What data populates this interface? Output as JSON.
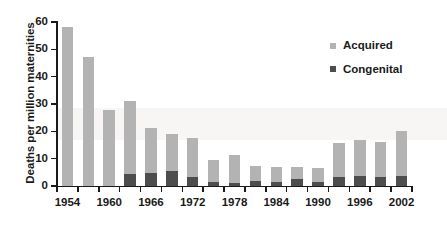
{
  "chart_data": {
    "type": "bar",
    "barmode": "stacked",
    "title": "",
    "xlabel": "",
    "ylabel": "Deaths per million maternities",
    "ylim": [
      0,
      60
    ],
    "ytick_labels": [
      "0",
      "10",
      "20",
      "30",
      "40",
      "50",
      "60"
    ],
    "ytick_values": [
      0,
      10,
      20,
      30,
      40,
      50,
      60
    ],
    "grid": false,
    "legend_position": "top-right",
    "categories": [
      1954,
      1957,
      1960,
      1963,
      1966,
      1969,
      1972,
      1975,
      1978,
      1981,
      1984,
      1987,
      1990,
      1993,
      1996,
      1999,
      2002
    ],
    "xtick_labels": [
      "1954",
      "1960",
      "1966",
      "1972",
      "1978",
      "1984",
      "1990",
      "1996",
      "2002"
    ],
    "xtick_values": [
      1954,
      1960,
      1966,
      1972,
      1978,
      1984,
      1990,
      1996,
      2002
    ],
    "series": [
      {
        "name": "Congenital",
        "color": "#4d4d4d",
        "values": [
          0,
          0,
          0,
          4.5,
          4.8,
          5.5,
          3.2,
          1.6,
          1.2,
          1.8,
          1.5,
          2.6,
          1.4,
          3.4,
          3.6,
          3.3,
          3.5
        ]
      },
      {
        "name": "Acquired",
        "color": "#b3b3b3",
        "values": [
          58.0,
          47.3,
          27.8,
          26.7,
          16.4,
          13.6,
          14.2,
          8.0,
          10.1,
          5.5,
          5.4,
          4.4,
          5.3,
          12.2,
          13.1,
          12.9,
          16.5
        ]
      }
    ],
    "totals": [
      58.0,
      47.3,
      27.8,
      31.2,
      21.2,
      19.1,
      17.4,
      9.6,
      11.3,
      7.3,
      6.9,
      7.0,
      6.7,
      15.6,
      16.7,
      16.2,
      20.0
    ]
  },
  "legend": {
    "items": [
      {
        "label": "Acquired",
        "color": "#b3b3b3"
      },
      {
        "label": "Congenital",
        "color": "#4d4d4d"
      }
    ]
  }
}
